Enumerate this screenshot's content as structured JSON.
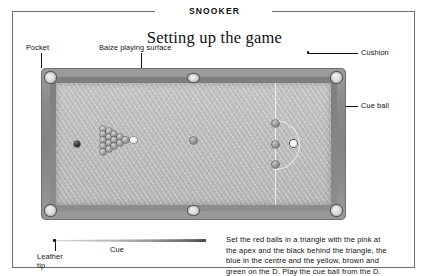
{
  "page": {
    "kicker": "SNOOKER",
    "title": "Setting up the game"
  },
  "callouts": {
    "pocket": "Pocket",
    "baize": "Baize playing surface",
    "cushion": "Cushion",
    "cue_ball": "Cue ball",
    "cue": "Cue",
    "leather_tip_line1": "Leather",
    "leather_tip_line2": "tip"
  },
  "caption": {
    "line1": "Set the red balls in a triangle with the pink at",
    "line2": "the apex and the black behind the triangle, the",
    "line3": "blue in the centre and the yellow, brown and",
    "line4": "green on the D. Play the cue ball from the D."
  },
  "colors": {
    "baize": "#bcbcbc",
    "frame": "#8b8b8b",
    "cushion": "#7e7e7e",
    "rule": "#6e6e6e",
    "ink": "#111111"
  },
  "diagram": {
    "balls": {
      "reds_count": 15,
      "pink": "pink-ball",
      "black": "black-ball",
      "blue": "blue-ball",
      "yellow": "yellow-ball",
      "brown": "brown-ball",
      "green": "green-ball",
      "cue": "cue-ball"
    },
    "pockets_count": 6
  }
}
